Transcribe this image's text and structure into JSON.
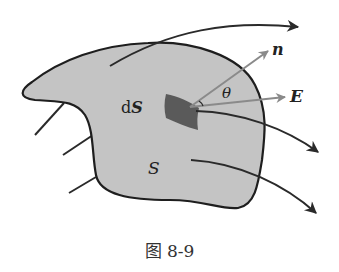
{
  "figure": {
    "caption": "图 8-9",
    "labels": {
      "normal": "n",
      "field": "E",
      "angle": "θ",
      "area_element": "dS",
      "area_element_d": "d",
      "area_element_s": "S",
      "surface": "S"
    },
    "colors": {
      "surface_fill": "#c4c4c4",
      "surface_stroke": "#1e1e1e",
      "area_element_fill": "#5a5a5a",
      "vector_color": "#8a8a8a",
      "field_line": "#2a2a2a"
    }
  }
}
